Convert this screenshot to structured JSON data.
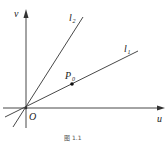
{
  "diagram": {
    "axes": {
      "x_label": "u",
      "y_label": "v",
      "origin_label": "O"
    },
    "lines": [
      {
        "name": "l1",
        "label_main": "l",
        "label_sub": "1"
      },
      {
        "name": "l2",
        "label_main": "l",
        "label_sub": "2"
      }
    ],
    "point": {
      "label_main": "P",
      "label_sub": "0"
    },
    "caption": "图  1.1",
    "colors": {
      "stroke": "#333333",
      "background": "#ffffff"
    }
  }
}
